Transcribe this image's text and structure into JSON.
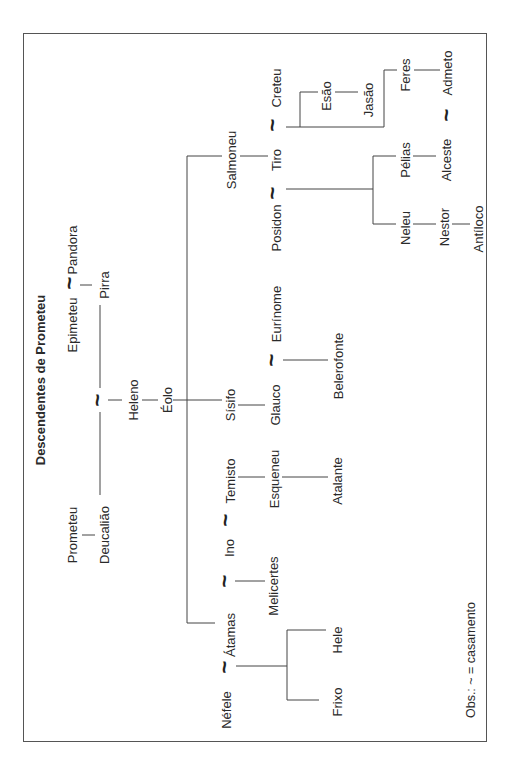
{
  "diagram": {
    "title": "Descendentes de Prometeu",
    "note": "Obs.: ~ = casamento",
    "marriage_symbol": "~",
    "nodes": [
      {
        "id": "pandora",
        "label": "Pandora",
        "x": 72,
        "y": 250
      },
      {
        "id": "epimeteu",
        "label": "Epimeteu",
        "x": 72,
        "y": 325
      },
      {
        "id": "pirra",
        "label": "Pirra",
        "x": 104,
        "y": 285
      },
      {
        "id": "prometeu",
        "label": "Prometeu",
        "x": 72,
        "y": 535
      },
      {
        "id": "deucaliao",
        "label": "Deucalião",
        "x": 104,
        "y": 535
      },
      {
        "id": "heleno",
        "label": "Heleno",
        "x": 133,
        "y": 400
      },
      {
        "id": "eolo",
        "label": "Éolo",
        "x": 167,
        "y": 400
      },
      {
        "id": "salmoneu",
        "label": "Salmoneu",
        "x": 231,
        "y": 160
      },
      {
        "id": "sisifo",
        "label": "Sísifo",
        "x": 230,
        "y": 405
      },
      {
        "id": "temisto",
        "label": "Temisto",
        "x": 230,
        "y": 481
      },
      {
        "id": "ino",
        "label": "Ino",
        "x": 229,
        "y": 548
      },
      {
        "id": "atamas",
        "label": "Átamas",
        "x": 230,
        "y": 635
      },
      {
        "id": "nefele",
        "label": "Néfele",
        "x": 226,
        "y": 710
      },
      {
        "id": "creteu",
        "label": "Creteu",
        "x": 276,
        "y": 88
      },
      {
        "id": "tiro",
        "label": "Tiro",
        "x": 276,
        "y": 160
      },
      {
        "id": "posidon",
        "label": "Posidon",
        "x": 276,
        "y": 228
      },
      {
        "id": "eurinome",
        "label": "Eurínome",
        "x": 276,
        "y": 314
      },
      {
        "id": "glauco",
        "label": "Glauco",
        "x": 275,
        "y": 405
      },
      {
        "id": "esqueneu",
        "label": "Esqueneu",
        "x": 274,
        "y": 479
      },
      {
        "id": "melicertes",
        "label": "Melicertes",
        "x": 273,
        "y": 586
      },
      {
        "id": "esao",
        "label": "Esão",
        "x": 326,
        "y": 96
      },
      {
        "id": "belerofonte",
        "label": "Belerofonte",
        "x": 338,
        "y": 366
      },
      {
        "id": "atalante",
        "label": "Atalante",
        "x": 337,
        "y": 481
      },
      {
        "id": "hele",
        "label": "Hele",
        "x": 337,
        "y": 640
      },
      {
        "id": "frixo",
        "label": "Frixo",
        "x": 337,
        "y": 702
      },
      {
        "id": "jasao",
        "label": "Jasão",
        "x": 368,
        "y": 100
      },
      {
        "id": "feres",
        "label": "Feres",
        "x": 405,
        "y": 75
      },
      {
        "id": "pelias",
        "label": "Pélias",
        "x": 405,
        "y": 160
      },
      {
        "id": "neleu",
        "label": "Neleu",
        "x": 405,
        "y": 228
      },
      {
        "id": "admeto",
        "label": "Admeto",
        "x": 447,
        "y": 73
      },
      {
        "id": "alceste",
        "label": "Alceste",
        "x": 446,
        "y": 160
      },
      {
        "id": "nestor",
        "label": "Nestor",
        "x": 444,
        "y": 227
      },
      {
        "id": "antiloco",
        "label": "Antíloco",
        "x": 478,
        "y": 229
      }
    ],
    "marriages": [
      {
        "between": [
          "Epimeteu",
          "Pandora"
        ],
        "x": 70,
        "y": 283
      },
      {
        "between": [
          "Deucalião",
          "Pirra"
        ],
        "x": 98,
        "y": 400
      },
      {
        "between": [
          "Tiro",
          "Creteu"
        ],
        "x": 273,
        "y": 125
      },
      {
        "between": [
          "Tiro",
          "Posidon"
        ],
        "x": 273,
        "y": 193
      },
      {
        "between": [
          "Glauco",
          "Eurínome"
        ],
        "x": 272,
        "y": 360
      },
      {
        "between": [
          "Ino",
          "Temisto"
        ],
        "x": 226,
        "y": 520
      },
      {
        "between": [
          "Átamas",
          "Ino"
        ],
        "x": 225,
        "y": 581
      },
      {
        "between": [
          "Átamas",
          "Néfele"
        ],
        "x": 225,
        "y": 667
      },
      {
        "between": [
          "Admeto",
          "Alceste"
        ],
        "x": 447,
        "y": 115
      }
    ],
    "positions": {
      "title": {
        "x": 40,
        "y": 380
      },
      "note": {
        "x": 471,
        "y": 660
      }
    }
  }
}
